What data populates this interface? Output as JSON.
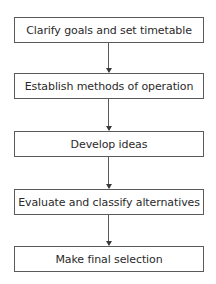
{
  "diagram": {
    "type": "flowchart",
    "direction": "top-to-bottom",
    "steps": [
      {
        "label": "Clarify goals and set timetable"
      },
      {
        "label": "Establish methods of operation"
      },
      {
        "label": "Develop ideas"
      },
      {
        "label": "Evaluate and classify alternatives"
      },
      {
        "label": "Make final selection"
      }
    ],
    "connectors": [
      {
        "from": 0,
        "to": 1
      },
      {
        "from": 1,
        "to": 2
      },
      {
        "from": 2,
        "to": 3
      },
      {
        "from": 3,
        "to": 4
      }
    ],
    "colors": {
      "border": "#5a5a5a",
      "text": "#2a2a2a",
      "background": "#ffffff"
    }
  }
}
